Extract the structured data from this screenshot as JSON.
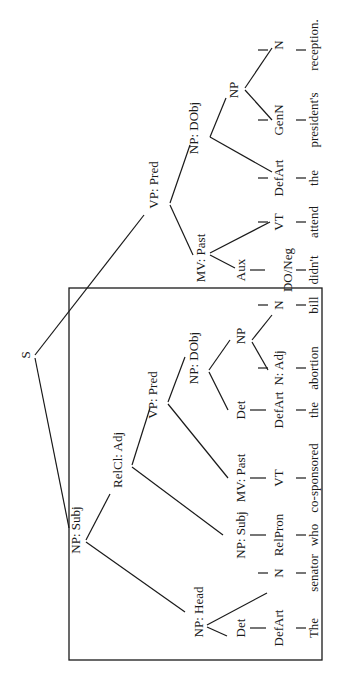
{
  "diagram": {
    "type": "syntax-tree",
    "orientation": "rotated-90-ccw",
    "sentence": "The senator who co-sponsored the abortion bill didn't attend the president's reception.",
    "box": {
      "x": 69,
      "y": 288,
      "w": 253,
      "h": 372
    },
    "nodes": [
      {
        "id": "s",
        "label": "S",
        "x": 30,
        "y": 355
      },
      {
        "id": "vp-pred",
        "label": "VP: Pred",
        "x": 158,
        "y": 185
      },
      {
        "id": "np-dobj",
        "label": "NP: DObj",
        "x": 198,
        "y": 128
      },
      {
        "id": "np-gen",
        "label": "NP",
        "x": 238,
        "y": 90
      },
      {
        "id": "n-reception",
        "label": "N",
        "x": 283,
        "y": 45
      },
      {
        "id": "genn",
        "label": "GenN",
        "x": 283,
        "y": 120
      },
      {
        "id": "defart-the2",
        "label": "DefArt",
        "x": 283,
        "y": 178
      },
      {
        "id": "mv-past",
        "label": "MV: Past",
        "x": 205,
        "y": 258
      },
      {
        "id": "vt-attend",
        "label": "VT",
        "x": 283,
        "y": 222
      },
      {
        "id": "aux",
        "label": "Aux",
        "x": 245,
        "y": 270
      },
      {
        "id": "do-neg",
        "label": "DO/Neg",
        "x": 292,
        "y": 270
      },
      {
        "id": "np-subj",
        "label": "NP: Subj",
        "x": 80,
        "y": 530
      },
      {
        "id": "relcl-adj",
        "label": "RelCl: Adj",
        "x": 122,
        "y": 460
      },
      {
        "id": "vp-pred-rel",
        "label": "VP: Pred",
        "x": 157,
        "y": 395
      },
      {
        "id": "np-dobj-rel",
        "label": "NP: DObj",
        "x": 198,
        "y": 358
      },
      {
        "id": "det-rel",
        "label": "Det",
        "x": 245,
        "y": 410
      },
      {
        "id": "np-rel",
        "label": "NP",
        "x": 245,
        "y": 336
      },
      {
        "id": "n-adj",
        "label": "N: Adj",
        "x": 283,
        "y": 368
      },
      {
        "id": "n-bill",
        "label": "N",
        "x": 283,
        "y": 305
      },
      {
        "id": "defart-the1",
        "label": "DefArt",
        "x": 283,
        "y": 410
      },
      {
        "id": "mv-past-rel",
        "label": "MV: Past",
        "x": 245,
        "y": 478
      },
      {
        "id": "vt-rel",
        "label": "VT",
        "x": 283,
        "y": 478
      },
      {
        "id": "np-subj-rel",
        "label": "NP: Subj",
        "x": 245,
        "y": 535
      },
      {
        "id": "relpron",
        "label": "RelPron",
        "x": 283,
        "y": 535
      },
      {
        "id": "np-head",
        "label": "NP: Head",
        "x": 203,
        "y": 612
      },
      {
        "id": "det-head",
        "label": "Det",
        "x": 245,
        "y": 628
      },
      {
        "id": "n-senator",
        "label": "N",
        "x": 283,
        "y": 573
      },
      {
        "id": "defart-the0",
        "label": "DefArt",
        "x": 283,
        "y": 628
      }
    ],
    "words": [
      {
        "id": "w-the0",
        "text": "The",
        "x": 318,
        "y": 628
      },
      {
        "id": "w-senator",
        "text": "senator",
        "x": 318,
        "y": 573
      },
      {
        "id": "w-who",
        "text": "who",
        "x": 318,
        "y": 535
      },
      {
        "id": "w-cosponsored",
        "text": "co-sponsored",
        "x": 318,
        "y": 478
      },
      {
        "id": "w-the1",
        "text": "the",
        "x": 318,
        "y": 410
      },
      {
        "id": "w-abortion",
        "text": "abortion",
        "x": 318,
        "y": 368
      },
      {
        "id": "w-bill",
        "text": "bill",
        "x": 318,
        "y": 305
      },
      {
        "id": "w-didnt",
        "text": "didn't",
        "x": 318,
        "y": 270
      },
      {
        "id": "w-attend",
        "text": "attend",
        "x": 318,
        "y": 222
      },
      {
        "id": "w-the2",
        "text": "the",
        "x": 318,
        "y": 178
      },
      {
        "id": "w-presidents",
        "text": "president's",
        "x": 318,
        "y": 120
      },
      {
        "id": "w-reception",
        "text": "reception.",
        "x": 318,
        "y": 45
      }
    ],
    "edges": [
      [
        35,
        355,
        144,
        215
      ],
      [
        35,
        358,
        69,
        528
      ],
      [
        170,
        203,
        190,
        145
      ],
      [
        170,
        205,
        193,
        255
      ],
      [
        210,
        137,
        226,
        98
      ],
      [
        210,
        137,
        272,
        172
      ],
      [
        245,
        88,
        272,
        48
      ],
      [
        245,
        90,
        272,
        120
      ],
      [
        210,
        253,
        270,
        222
      ],
      [
        210,
        255,
        235,
        268
      ],
      [
        86,
        540,
        110,
        494
      ],
      [
        86,
        542,
        185,
        612
      ],
      [
        132,
        465,
        150,
        408
      ],
      [
        132,
        467,
        223,
        535
      ],
      [
        168,
        402,
        185,
        357
      ],
      [
        168,
        404,
        228,
        478
      ],
      [
        209,
        370,
        230,
        340
      ],
      [
        209,
        372,
        228,
        410
      ],
      [
        252,
        340,
        272,
        315
      ],
      [
        252,
        342,
        268,
        370
      ],
      [
        207,
        625,
        267,
        593
      ],
      [
        207,
        627,
        227,
        636
      ]
    ],
    "vlines": [
      [
        258,
        50,
        268,
        50
      ],
      [
        296,
        50,
        306,
        50
      ],
      [
        258,
        120,
        268,
        120
      ],
      [
        296,
        120,
        306,
        120
      ],
      [
        258,
        178,
        268,
        178
      ],
      [
        296,
        178,
        306,
        178
      ],
      [
        258,
        222,
        268,
        222
      ],
      [
        296,
        222,
        306,
        222
      ],
      [
        250,
        270,
        265,
        270
      ],
      [
        296,
        270,
        306,
        270
      ],
      [
        258,
        305,
        268,
        305
      ],
      [
        296,
        305,
        306,
        305
      ],
      [
        258,
        368,
        268,
        368
      ],
      [
        296,
        368,
        306,
        368
      ],
      [
        250,
        410,
        266,
        410
      ],
      [
        296,
        410,
        306,
        410
      ],
      [
        250,
        478,
        266,
        478
      ],
      [
        296,
        478,
        306,
        478
      ],
      [
        250,
        535,
        266,
        535
      ],
      [
        296,
        535,
        306,
        535
      ],
      [
        258,
        573,
        268,
        573
      ],
      [
        296,
        573,
        306,
        573
      ],
      [
        250,
        628,
        266,
        628
      ],
      [
        296,
        628,
        306,
        628
      ]
    ]
  }
}
